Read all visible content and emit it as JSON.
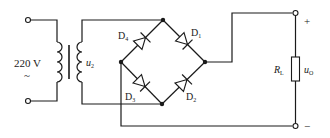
{
  "diagram": {
    "source": {
      "voltage_label": "220 V",
      "ac_symbol": "~"
    },
    "transformer": {
      "secondary_label": "u",
      "secondary_sub": "2"
    },
    "diodes": [
      {
        "name": "D",
        "sub": "1"
      },
      {
        "name": "D",
        "sub": "2"
      },
      {
        "name": "D",
        "sub": "3"
      },
      {
        "name": "D",
        "sub": "4"
      }
    ],
    "load": {
      "label": "R",
      "sub": "L"
    },
    "output": {
      "label": "u",
      "sub": "O",
      "plus": "+",
      "minus": "−"
    }
  }
}
